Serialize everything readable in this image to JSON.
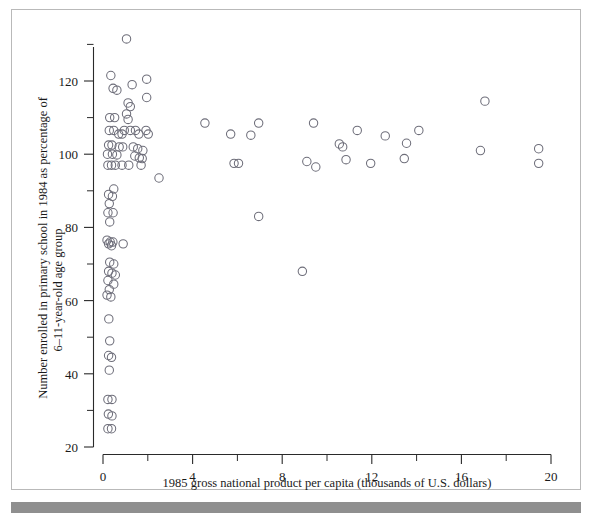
{
  "chart_data": {
    "type": "scatter",
    "title": "",
    "xlabel": "1985 gross national product per capita (thousands of U.S. dollars)",
    "ylabel": "Number enrolled in primary school in 1984 as percentage of 6–11-year-old age group",
    "ylabel_line1": "Number enrolled in primary school in 1984 as percentage of",
    "ylabel_line2": "6–11-year-old age group",
    "xlim": [
      0,
      20
    ],
    "ylim": [
      20,
      133
    ],
    "xticks": [
      0,
      4,
      8,
      12,
      16,
      20
    ],
    "xticklabels": [
      "0",
      "4",
      "8",
      "12",
      "16",
      "20"
    ],
    "xminorticks": [
      2,
      6,
      10,
      14,
      18
    ],
    "yticks": [
      20,
      40,
      60,
      80,
      100,
      120
    ],
    "yticklabels": [
      "20",
      "40",
      "60",
      "80",
      "100",
      "120"
    ],
    "yminorticks": [
      30,
      50,
      70,
      90,
      110,
      130
    ],
    "grid": false,
    "legend": null,
    "marker": "open-circle",
    "marker_color": "#6d6d79",
    "points": [
      [
        1.05,
        131.5
      ],
      [
        0.35,
        121.5
      ],
      [
        1.95,
        120.5
      ],
      [
        0.45,
        118.0
      ],
      [
        0.62,
        117.5
      ],
      [
        1.3,
        119.0
      ],
      [
        1.95,
        115.5
      ],
      [
        1.12,
        114.0
      ],
      [
        1.22,
        113.0
      ],
      [
        1.05,
        111.0
      ],
      [
        0.3,
        110.0
      ],
      [
        0.52,
        110.0
      ],
      [
        1.12,
        109.5
      ],
      [
        4.55,
        108.5
      ],
      [
        6.95,
        108.5
      ],
      [
        9.4,
        108.5
      ],
      [
        0.28,
        106.5
      ],
      [
        0.48,
        106.5
      ],
      [
        0.95,
        106.5
      ],
      [
        1.22,
        106.5
      ],
      [
        1.45,
        106.5
      ],
      [
        1.92,
        106.5
      ],
      [
        11.35,
        106.5
      ],
      [
        14.1,
        106.5
      ],
      [
        0.7,
        105.5
      ],
      [
        0.85,
        105.5
      ],
      [
        1.6,
        105.5
      ],
      [
        2.02,
        105.5
      ],
      [
        5.7,
        105.5
      ],
      [
        6.6,
        105.2
      ],
      [
        12.6,
        105.0
      ],
      [
        17.05,
        114.5
      ],
      [
        0.25,
        102.5
      ],
      [
        0.4,
        102.5
      ],
      [
        0.72,
        102.0
      ],
      [
        0.88,
        102.0
      ],
      [
        1.35,
        102.0
      ],
      [
        1.55,
        101.5
      ],
      [
        1.78,
        101.0
      ],
      [
        19.45,
        101.5
      ],
      [
        0.2,
        100.0
      ],
      [
        0.42,
        100.0
      ],
      [
        0.62,
        99.8
      ],
      [
        1.42,
        99.5
      ],
      [
        1.62,
        99.0
      ],
      [
        1.75,
        98.8
      ],
      [
        10.55,
        102.8
      ],
      [
        10.7,
        102.0
      ],
      [
        13.55,
        103.0
      ],
      [
        0.22,
        97.0
      ],
      [
        0.38,
        97.0
      ],
      [
        0.55,
        97.0
      ],
      [
        0.85,
        97.0
      ],
      [
        1.15,
        97.0
      ],
      [
        1.7,
        97.0
      ],
      [
        5.85,
        97.5
      ],
      [
        6.05,
        97.5
      ],
      [
        9.1,
        98.0
      ],
      [
        9.5,
        96.5
      ],
      [
        10.85,
        98.5
      ],
      [
        11.95,
        97.5
      ],
      [
        13.45,
        98.8
      ],
      [
        16.85,
        101.0
      ],
      [
        19.45,
        97.5
      ],
      [
        2.5,
        93.5
      ],
      [
        0.48,
        90.5
      ],
      [
        0.25,
        89.0
      ],
      [
        0.42,
        88.5
      ],
      [
        0.28,
        86.5
      ],
      [
        0.22,
        84.0
      ],
      [
        0.45,
        84.0
      ],
      [
        0.3,
        81.5
      ],
      [
        0.18,
        76.5
      ],
      [
        0.32,
        76.0
      ],
      [
        0.44,
        76.0
      ],
      [
        0.25,
        75.5
      ],
      [
        0.38,
        75.0
      ],
      [
        0.9,
        75.5
      ],
      [
        0.3,
        70.5
      ],
      [
        0.48,
        70.0
      ],
      [
        0.25,
        68.0
      ],
      [
        0.4,
        67.5
      ],
      [
        0.55,
        67.0
      ],
      [
        0.22,
        65.5
      ],
      [
        0.48,
        64.5
      ],
      [
        0.28,
        63.0
      ],
      [
        0.18,
        61.5
      ],
      [
        0.35,
        61.0
      ],
      [
        0.26,
        55.0
      ],
      [
        0.3,
        49.0
      ],
      [
        0.25,
        45.0
      ],
      [
        0.38,
        44.5
      ],
      [
        0.28,
        41.0
      ],
      [
        0.22,
        33.0
      ],
      [
        0.4,
        33.0
      ],
      [
        0.24,
        29.0
      ],
      [
        0.4,
        28.5
      ],
      [
        0.22,
        25.0
      ],
      [
        0.38,
        25.0
      ],
      [
        6.95,
        83.0
      ],
      [
        8.9,
        68.0
      ]
    ],
    "point_count": 103
  }
}
